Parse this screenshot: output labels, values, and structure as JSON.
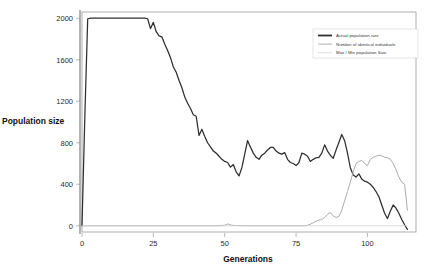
{
  "chart_data": {
    "type": "line",
    "title": "",
    "xlabel": "Generations",
    "ylabel": "Population size",
    "xlim": [
      0,
      117
    ],
    "ylim": [
      -60,
      2060
    ],
    "grid": false,
    "legend_position": "top-right",
    "xticks": [
      0,
      25,
      50,
      75,
      100
    ],
    "xtick_labels": [
      "0",
      "25",
      "50",
      "75",
      "100"
    ],
    "yticks": [
      0,
      400,
      800,
      1200,
      1600,
      2000
    ],
    "ytick_labels": [
      "0",
      "400",
      "800",
      "1200",
      "1600",
      "2000"
    ],
    "series": [
      {
        "name": "Actual population size",
        "color": "#2e2e2e",
        "x": [
          0,
          1,
          2,
          3,
          4,
          5,
          6,
          7,
          8,
          9,
          10,
          11,
          12,
          13,
          14,
          15,
          16,
          17,
          18,
          19,
          20,
          21,
          22,
          23,
          24,
          25,
          26,
          27,
          28,
          29,
          30,
          31,
          32,
          33,
          34,
          35,
          36,
          37,
          38,
          39,
          40,
          41,
          42,
          43,
          44,
          45,
          46,
          47,
          48,
          49,
          50,
          51,
          52,
          53,
          54,
          55,
          56,
          57,
          58,
          59,
          60,
          61,
          62,
          63,
          64,
          65,
          66,
          67,
          68,
          69,
          70,
          71,
          72,
          73,
          74,
          75,
          76,
          77,
          78,
          79,
          80,
          81,
          82,
          83,
          84,
          85,
          86,
          87,
          88,
          89,
          90,
          91,
          92,
          93,
          94,
          95,
          96,
          97,
          98,
          99,
          100,
          101,
          102,
          103,
          104,
          105,
          106,
          107,
          108,
          109,
          110,
          111,
          112,
          113,
          114
        ],
        "values": [
          0,
          1060,
          1995,
          2000,
          2000,
          2000,
          2000,
          2000,
          2000,
          2000,
          2000,
          2000,
          2000,
          2000,
          2000,
          2000,
          2000,
          2000,
          2000,
          2000,
          2000,
          2000,
          2000,
          1995,
          1900,
          1960,
          1870,
          1830,
          1820,
          1750,
          1690,
          1620,
          1530,
          1480,
          1400,
          1330,
          1240,
          1180,
          1130,
          1070,
          1055,
          870,
          930,
          860,
          800,
          760,
          720,
          700,
          670,
          640,
          620,
          610,
          565,
          590,
          520,
          480,
          560,
          690,
          820,
          760,
          700,
          660,
          640,
          680,
          700,
          730,
          755,
          755,
          720,
          700,
          690,
          705,
          640,
          610,
          600,
          580,
          610,
          700,
          690,
          670,
          620,
          640,
          655,
          660,
          700,
          780,
          720,
          680,
          650,
          730,
          805,
          880,
          820,
          700,
          560,
          490,
          470,
          500,
          450,
          430,
          420,
          400,
          370,
          330,
          280,
          200,
          120,
          70,
          140,
          200,
          170,
          120,
          60,
          10,
          -35
        ],
        "linewidth": 1.25
      },
      {
        "name": "Number of identical individuals",
        "color": "#a8a8a8",
        "x": [
          0,
          5,
          10,
          15,
          20,
          25,
          30,
          35,
          40,
          45,
          48,
          50,
          51,
          52,
          53,
          54,
          55,
          56,
          58,
          60,
          62,
          64,
          66,
          68,
          70,
          72,
          74,
          76,
          78,
          79,
          80,
          81,
          82,
          83,
          84,
          85,
          86,
          87,
          88,
          89,
          90,
          91,
          92,
          93,
          94,
          95,
          96,
          97,
          98,
          99,
          100,
          101,
          102,
          103,
          104,
          105,
          106,
          107,
          108,
          109,
          110,
          111,
          112,
          113,
          114
        ],
        "values": [
          0,
          0,
          0,
          0,
          0,
          0,
          0,
          0,
          0,
          0,
          0,
          5,
          18,
          8,
          4,
          2,
          2,
          0,
          0,
          0,
          0,
          0,
          0,
          0,
          0,
          0,
          0,
          0,
          0,
          5,
          15,
          30,
          45,
          55,
          60,
          80,
          110,
          130,
          95,
          80,
          90,
          150,
          240,
          330,
          420,
          520,
          600,
          620,
          630,
          600,
          580,
          640,
          660,
          670,
          680,
          675,
          660,
          655,
          640,
          600,
          540,
          470,
          420,
          400,
          150
        ],
        "linewidth": 0.95
      },
      {
        "name": "Max / Min population Size",
        "color": "#d2d2d2",
        "x": [
          0,
          114
        ],
        "values": [
          0,
          0
        ],
        "linewidth": 0.8
      }
    ]
  },
  "legend": {
    "entries": [
      {
        "label": "Actual population size",
        "color": "#2e2e2e"
      },
      {
        "label": "Number of identical individuals",
        "color": "#a8a8a8"
      },
      {
        "label": "Max / Min population Size",
        "color": "#d2d2d2"
      }
    ]
  }
}
